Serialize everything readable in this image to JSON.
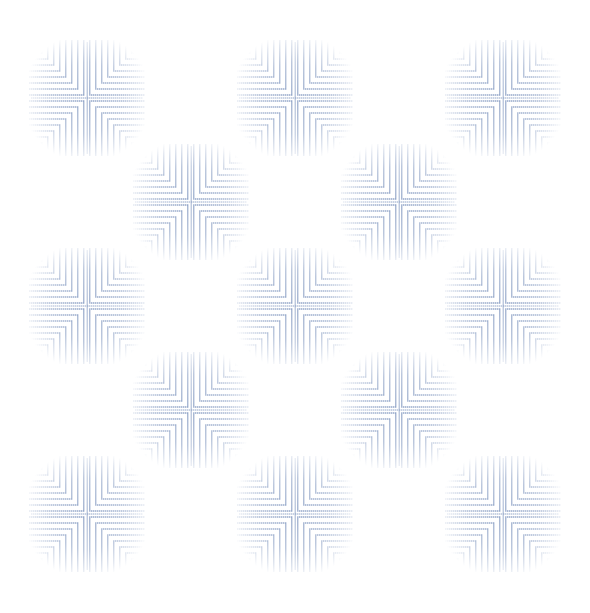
{
  "pattern": {
    "name": "concentric-square-quadrant-tiles",
    "background_color": "#ffffff",
    "stroke_color": "#8ea2c6",
    "tile_size": 124,
    "ring_spacing": 6,
    "ring_count": 9,
    "tiles": [
      {
        "cx": 87,
        "cy": 98
      },
      {
        "cx": 295,
        "cy": 98
      },
      {
        "cx": 503,
        "cy": 98
      },
      {
        "cx": 191,
        "cy": 202
      },
      {
        "cx": 399,
        "cy": 202
      },
      {
        "cx": 87,
        "cy": 306
      },
      {
        "cx": 295,
        "cy": 306
      },
      {
        "cx": 503,
        "cy": 306
      },
      {
        "cx": 191,
        "cy": 410
      },
      {
        "cx": 399,
        "cy": 410
      },
      {
        "cx": 87,
        "cy": 514
      },
      {
        "cx": 295,
        "cy": 514
      },
      {
        "cx": 503,
        "cy": 514
      }
    ]
  }
}
